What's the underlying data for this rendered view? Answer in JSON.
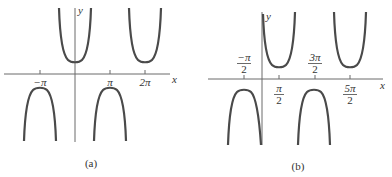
{
  "panels": [
    {
      "caption": "(a)",
      "axis_labels": {
        "x": "x",
        "y": "y"
      },
      "ticks": [
        {
          "label": "−π",
          "value": "-pi"
        },
        {
          "label": "π",
          "value": "pi"
        },
        {
          "label": "2π",
          "value": "2pi"
        }
      ],
      "function": "y = sec x",
      "branches": [
        {
          "type": "U",
          "center": "0"
        },
        {
          "type": "U",
          "center": "2pi"
        },
        {
          "type": "cap",
          "center": "-pi"
        },
        {
          "type": "cap",
          "center": "pi"
        }
      ]
    },
    {
      "caption": "(b)",
      "axis_labels": {
        "x": "x",
        "y": "y"
      },
      "ticks": [
        {
          "num": "−π",
          "den": "2",
          "position": "above"
        },
        {
          "num": "π",
          "den": "2",
          "position": "below"
        },
        {
          "num": "3π",
          "den": "2",
          "position": "above"
        },
        {
          "num": "5π",
          "den": "2",
          "position": "below"
        }
      ],
      "function": "y = csc x",
      "branches": [
        {
          "type": "U",
          "center": "pi/2"
        },
        {
          "type": "U",
          "center": "5pi/2"
        },
        {
          "type": "cap",
          "center": "-pi/2"
        },
        {
          "type": "cap",
          "center": "3pi/2"
        }
      ]
    }
  ]
}
